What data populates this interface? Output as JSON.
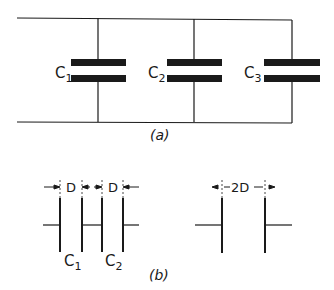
{
  "figure_a": {
    "caption": "(a)",
    "capacitors": [
      {
        "name": "C",
        "sub": "1"
      },
      {
        "name": "C",
        "sub": "2"
      },
      {
        "name": "C",
        "sub": "3"
      }
    ]
  },
  "figure_b": {
    "caption": "(b)",
    "series_labels": [
      {
        "name": "C",
        "sub": "1"
      },
      {
        "name": "C",
        "sub": "2"
      }
    ],
    "dimension_left": "D",
    "dimension_right": "D",
    "equivalent_dimension": "2D"
  },
  "colors": {
    "ink": "#1a1a1a",
    "background": "#ffffff"
  }
}
